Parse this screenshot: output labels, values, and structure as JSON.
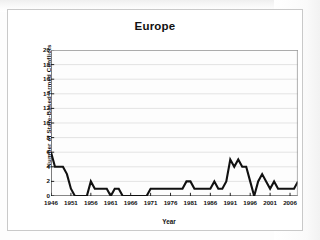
{
  "chart_data": {
    "type": "line",
    "title": "Europe",
    "xlabel": "Year",
    "ylabel": "Number of State-Based Armed Conflicts",
    "xlim": [
      1946,
      2008
    ],
    "ylim": [
      0,
      20
    ],
    "ytick_step": 2,
    "xtick_step": 5,
    "grid": true,
    "legend": null,
    "line_color": "#111111",
    "plot_background": "#fdfdfd",
    "gridline_color": "#d8d8d8",
    "yticks": [
      20,
      18,
      16,
      14,
      12,
      10,
      8,
      6,
      4,
      2,
      0
    ],
    "xticks": [
      1946,
      1951,
      1956,
      1961,
      1966,
      1971,
      1976,
      1981,
      1986,
      1991,
      1996,
      2001,
      2006
    ],
    "x": [
      1946,
      1947,
      1948,
      1949,
      1950,
      1951,
      1952,
      1953,
      1954,
      1955,
      1956,
      1957,
      1958,
      1959,
      1960,
      1961,
      1962,
      1963,
      1964,
      1965,
      1966,
      1967,
      1968,
      1969,
      1970,
      1971,
      1972,
      1973,
      1974,
      1975,
      1976,
      1977,
      1978,
      1979,
      1980,
      1981,
      1982,
      1983,
      1984,
      1985,
      1986,
      1987,
      1988,
      1989,
      1990,
      1991,
      1992,
      1993,
      1994,
      1995,
      1996,
      1997,
      1998,
      1999,
      2000,
      2001,
      2002,
      2003,
      2004,
      2005,
      2006,
      2007,
      2008
    ],
    "values": [
      6,
      4,
      4,
      4,
      3,
      1,
      0,
      0,
      0,
      0,
      2,
      1,
      1,
      1,
      1,
      0,
      1,
      1,
      0,
      0,
      0,
      0,
      0,
      0,
      0,
      1,
      1,
      1,
      1,
      1,
      1,
      1,
      1,
      1,
      2,
      2,
      1,
      1,
      1,
      1,
      1,
      2,
      1,
      1,
      2,
      5,
      4,
      5,
      4,
      4,
      2,
      0,
      2,
      3,
      2,
      1,
      2,
      1,
      1,
      1,
      1,
      1,
      2
    ],
    "series_name": "Europe"
  }
}
